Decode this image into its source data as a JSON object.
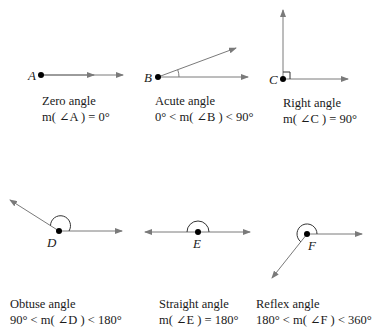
{
  "colors": {
    "ray": "#7a7a7a",
    "vertex": "#000000",
    "text": "#1a1a1a"
  },
  "angles": [
    {
      "id": "zero",
      "vertex_label": "A",
      "title": "Zero angle",
      "formula": "m( ∠A ) = 0°"
    },
    {
      "id": "acute",
      "vertex_label": "B",
      "title": "Acute angle",
      "formula": "0° < m( ∠B ) < 90°"
    },
    {
      "id": "right",
      "vertex_label": "C",
      "title": "Right angle",
      "formula": "m( ∠C ) = 90°"
    },
    {
      "id": "obtuse",
      "vertex_label": "D",
      "title": "Obtuse angle",
      "formula": "90° < m( ∠D ) < 180°"
    },
    {
      "id": "straight",
      "vertex_label": "E",
      "title": "Straight angle",
      "formula": "m( ∠E ) = 180°"
    },
    {
      "id": "reflex",
      "vertex_label": "F",
      "title": "Reflex angle",
      "formula": "180° < m( ∠F ) < 360°"
    }
  ]
}
